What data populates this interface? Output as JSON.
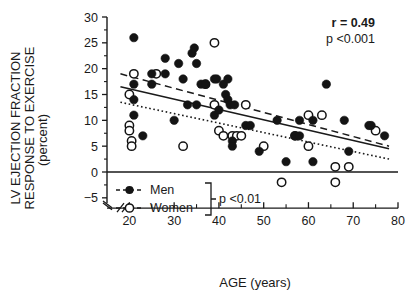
{
  "chart_data": {
    "type": "scatter",
    "title": "",
    "xlabel": "AGE (years)",
    "ylabel": "LV EJECTION FRACTION RESPONSE TO EXERCISE (percent)",
    "ylabel_line1": "LV EJECTION FRACTION",
    "ylabel_line2": "RESPONSE TO EXERCISE",
    "ylabel_line3": "(percent)",
    "xlim": [
      15,
      80
    ],
    "ylim": [
      -7,
      30
    ],
    "xticks": [
      20,
      30,
      40,
      50,
      60,
      70,
      80
    ],
    "xtick_labels": [
      "20",
      "30",
      "40",
      "50",
      "60",
      "70",
      "80"
    ],
    "x_minor_ticks": [
      25,
      35,
      45,
      55,
      65,
      75
    ],
    "yticks": [
      -5,
      0,
      5,
      10,
      15,
      20,
      25,
      30
    ],
    "ytick_labels": [
      "−5",
      "0",
      "5",
      "10",
      "15",
      "20",
      "25",
      "30"
    ],
    "grid": false,
    "axis_break_x": true,
    "zero_line": 0,
    "series": [
      {
        "name": "Men",
        "marker": "filled-circle",
        "color": "#141414",
        "points": [
          [
            21,
            26
          ],
          [
            21,
            17
          ],
          [
            21,
            14
          ],
          [
            21,
            11
          ],
          [
            23,
            7
          ],
          [
            25,
            19
          ],
          [
            25,
            17
          ],
          [
            28,
            22
          ],
          [
            28,
            19
          ],
          [
            30,
            10
          ],
          [
            31,
            21
          ],
          [
            32,
            18
          ],
          [
            33,
            13
          ],
          [
            34,
            23
          ],
          [
            34.5,
            24
          ],
          [
            35,
            13
          ],
          [
            35,
            21
          ],
          [
            36,
            17
          ],
          [
            37,
            17
          ],
          [
            39,
            18
          ],
          [
            39.5,
            18
          ],
          [
            39,
            11
          ],
          [
            40,
            12
          ],
          [
            41,
            17
          ],
          [
            41.5,
            15
          ],
          [
            42,
            14
          ],
          [
            42,
            18
          ],
          [
            42.5,
            13
          ],
          [
            43,
            6
          ],
          [
            43,
            5
          ],
          [
            43.5,
            13
          ],
          [
            46,
            9
          ],
          [
            47,
            9
          ],
          [
            49,
            4
          ],
          [
            53,
            10
          ],
          [
            55,
            2
          ],
          [
            57,
            7
          ],
          [
            58,
            7
          ],
          [
            58,
            10
          ],
          [
            61,
            2
          ],
          [
            61,
            10
          ],
          [
            64,
            17
          ],
          [
            68,
            10
          ],
          [
            69,
            4
          ],
          [
            73.5,
            9
          ],
          [
            74,
            9
          ],
          [
            77,
            7
          ]
        ]
      },
      {
        "name": "Women",
        "marker": "open-circle",
        "color": "#141414",
        "points": [
          [
            20,
            15
          ],
          [
            20,
            9
          ],
          [
            20,
            8
          ],
          [
            20.5,
            6
          ],
          [
            20.5,
            5
          ],
          [
            21,
            19
          ],
          [
            26,
            19
          ],
          [
            32,
            5
          ],
          [
            37,
            17
          ],
          [
            39,
            25
          ],
          [
            39,
            13
          ],
          [
            40,
            8
          ],
          [
            41,
            7
          ],
          [
            43,
            7
          ],
          [
            44,
            7
          ],
          [
            45,
            7
          ],
          [
            46,
            13
          ],
          [
            50,
            5
          ],
          [
            54,
            -2
          ],
          [
            57,
            7
          ],
          [
            60,
            11
          ],
          [
            60,
            5
          ],
          [
            63,
            11
          ],
          [
            66,
            1
          ],
          [
            66,
            -2
          ],
          [
            69,
            1
          ],
          [
            75,
            8
          ]
        ]
      }
    ],
    "fit_lines": [
      {
        "name": "men-fit",
        "style": "dashed",
        "x": [
          18,
          78
        ],
        "y": [
          19.0,
          5.0
        ]
      },
      {
        "name": "overall-fit",
        "style": "solid",
        "x": [
          18,
          78
        ],
        "y": [
          16.5,
          4.5
        ]
      },
      {
        "name": "women-fit",
        "style": "dotted",
        "x": [
          18,
          78
        ],
        "y": [
          13.5,
          2.5
        ]
      }
    ],
    "annotations": [
      {
        "name": "correlation",
        "text": "r  =  0.49",
        "bold": true
      },
      {
        "name": "p-value",
        "text": "p <0.001",
        "bold": false
      },
      {
        "name": "group-comparison-p",
        "text": "p <0.01",
        "bold": false
      }
    ]
  },
  "legend": {
    "position": "lower-left",
    "items": [
      {
        "label": "Men",
        "marker": "filled-circle"
      },
      {
        "label": "Women",
        "marker": "open-circle"
      }
    ],
    "bracket_note": "p <0.01"
  }
}
